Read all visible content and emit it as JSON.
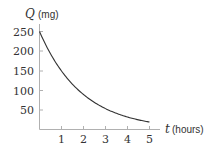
{
  "chart_data": {
    "type": "line",
    "title": "",
    "xlabel": "t (hours)",
    "ylabel": "Q (mg)",
    "xlabel_var": "t",
    "xlabel_unit": "(hours)",
    "ylabel_var": "Q",
    "ylabel_unit": "(mg)",
    "xlim": [
      0,
      5
    ],
    "ylim": [
      0,
      250
    ],
    "x_ticks": [
      1,
      2,
      3,
      4,
      5
    ],
    "y_ticks": [
      50,
      100,
      150,
      200,
      250
    ],
    "grid": false,
    "legend": null,
    "series": [
      {
        "name": "Q(t)",
        "x": [
          0,
          0.5,
          1,
          1.5,
          2,
          2.5,
          3,
          3.5,
          4,
          4.5,
          5
        ],
        "values": [
          250,
          194,
          150,
          116,
          90,
          70,
          54,
          42,
          32,
          25,
          19
        ]
      }
    ]
  },
  "axes": {
    "y_label_var": "Q",
    "y_label_unit": "(mg)",
    "x_label_var": "t",
    "x_label_unit": "(hours)",
    "x_tick_labels": [
      "1",
      "2",
      "3",
      "4",
      "5"
    ],
    "y_tick_labels": [
      "50",
      "100",
      "150",
      "200",
      "250"
    ]
  },
  "colors": {
    "curve": "#333333",
    "axis": "#b0b0b0"
  }
}
